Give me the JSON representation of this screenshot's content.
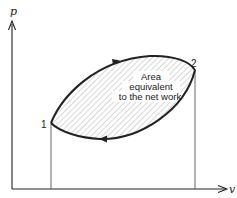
{
  "diagram": {
    "type": "p-v cycle diagram",
    "axes": {
      "y_label": "p",
      "x_label": "v"
    },
    "points": [
      {
        "label": "1",
        "x": 51,
        "y": 123
      },
      {
        "label": "2",
        "x": 195,
        "y": 70
      }
    ],
    "area_annotation": {
      "lines": [
        "Area",
        "equivalent",
        "to the net work"
      ]
    },
    "colors": {
      "stroke": "#222222",
      "hatch": "#9a9a9a",
      "background": "#ffffff"
    },
    "process_directions": {
      "upper_curve": "1 to 2 (rightward)",
      "lower_curve": "2 to 1 (leftward)"
    }
  }
}
